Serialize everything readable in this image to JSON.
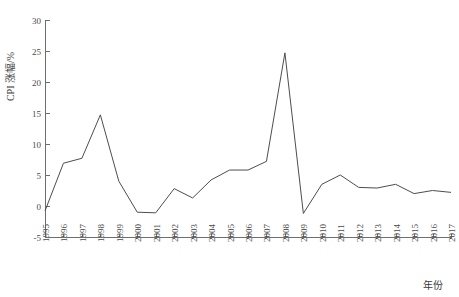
{
  "chart_data": {
    "type": "line",
    "title": "",
    "subtitle": "",
    "xlabel": "年份",
    "ylabel": "CPI 涨幅/%",
    "xlim": [
      1995,
      2017
    ],
    "ylim": [
      -5,
      30
    ],
    "grid": false,
    "legend": false,
    "legend_position": "none",
    "line_color": "#4d4d4d",
    "axis_color": "#6e6e6e",
    "y_ticks": [
      -5,
      0,
      5,
      10,
      15,
      20,
      25,
      30
    ],
    "y_tick_labels": [
      "-5",
      "0",
      "5",
      "10",
      "15",
      "20",
      "25",
      "30"
    ],
    "x_ticks": [
      1995,
      1996,
      1997,
      1998,
      1999,
      2000,
      2001,
      2002,
      2003,
      2004,
      2005,
      2006,
      2007,
      2008,
      2009,
      2010,
      2011,
      2012,
      2013,
      2014,
      2015,
      2016,
      2017
    ],
    "x_tick_labels": [
      "1995",
      "1996",
      "1997",
      "1998",
      "1999",
      "2000",
      "2001",
      "2002",
      "2003",
      "2004",
      "2005",
      "2006",
      "2007",
      "2008",
      "2009",
      "2010",
      "2011",
      "2012",
      "2013",
      "2014",
      "2015",
      "2016",
      "2017"
    ],
    "categories": [
      1995,
      1996,
      1997,
      1998,
      1999,
      2000,
      2001,
      2002,
      2003,
      2004,
      2005,
      2006,
      2007,
      2008,
      2009,
      2010,
      2011,
      2012,
      2013,
      2014,
      2015,
      2016,
      2017
    ],
    "values": [
      -0.8,
      6.9,
      7.7,
      14.7,
      4.0,
      -1.0,
      -1.1,
      2.8,
      1.3,
      4.2,
      5.8,
      5.8,
      7.2,
      24.7,
      -1.2,
      3.5,
      5.0,
      3.0,
      2.9,
      3.5,
      2.0,
      2.5,
      2.2
    ],
    "series": [
      {
        "name": "CPI 涨幅",
        "values": [
          -0.8,
          6.9,
          7.7,
          14.7,
          4.0,
          -1.0,
          -1.1,
          2.8,
          1.3,
          4.2,
          5.8,
          5.8,
          7.2,
          24.7,
          -1.2,
          3.5,
          5.0,
          3.0,
          2.9,
          3.5,
          2.0,
          2.5,
          2.2
        ]
      }
    ]
  },
  "plot": {
    "left": 45,
    "right": 451,
    "top": 20,
    "bottom": 237
  }
}
